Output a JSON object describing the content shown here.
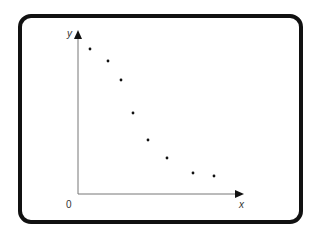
{
  "chart_data": {
    "type": "scatter",
    "title": "",
    "xlabel": "x",
    "ylabel": "y",
    "origin_label": "0",
    "grid": false,
    "legend": null,
    "points_px": [
      {
        "x": 90,
        "y": 49
      },
      {
        "x": 108,
        "y": 61
      },
      {
        "x": 121,
        "y": 80
      },
      {
        "x": 133,
        "y": 113
      },
      {
        "x": 148,
        "y": 140
      },
      {
        "x": 167,
        "y": 158
      },
      {
        "x": 193,
        "y": 173
      },
      {
        "x": 214,
        "y": 176
      }
    ],
    "points": [
      {
        "x": 1,
        "y": 9.4
      },
      {
        "x": 2,
        "y": 8.7
      },
      {
        "x": 2.7,
        "y": 7.6
      },
      {
        "x": 3.4,
        "y": 5.6
      },
      {
        "x": 4.2,
        "y": 4.0
      },
      {
        "x": 5.2,
        "y": 2.9
      },
      {
        "x": 6.6,
        "y": 2.0
      },
      {
        "x": 7.8,
        "y": 1.8
      }
    ]
  },
  "axes": {
    "origin": [
      78,
      194
    ],
    "x_end": 242,
    "y_end": 32
  }
}
